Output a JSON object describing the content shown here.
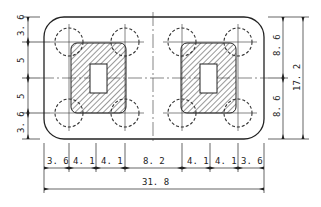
{
  "diagram": {
    "type": "engineering-plan-drawing",
    "colors": {
      "line": "#222222",
      "background": "#ffffff"
    },
    "left_dimensions": [
      "3.6",
      "5",
      "5",
      "3.6"
    ],
    "left_labels": [
      "3. 6",
      "5",
      "5",
      "3. 6"
    ],
    "right_dimensions": [
      "8.6",
      "8.6"
    ],
    "right_labels": [
      "8. 6",
      "8. 6"
    ],
    "right_total_label": "17. 2",
    "bottom_dimensions": [
      "3.6",
      "4.1",
      "4.1",
      "8.2",
      "4.1",
      "4.1",
      "3.6"
    ],
    "bottom_labels": [
      "3. 6",
      "4. 1",
      "4. 1",
      "8. 2",
      "4. 1",
      "4. 1",
      "3. 6"
    ],
    "bottom_total_label": "31. 8",
    "pile_count": 8,
    "column_count": 2
  }
}
